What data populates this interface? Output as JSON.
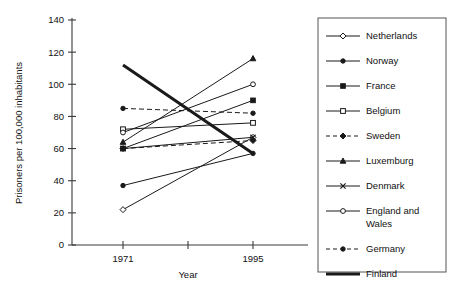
{
  "chart_data": {
    "type": "line",
    "title": "",
    "xlabel": "Year",
    "ylabel": "Prisoners per 100,000 inhabitants",
    "categories": [
      "1971",
      "1995"
    ],
    "x": [
      1971,
      1995
    ],
    "xlim": [
      1971,
      1995
    ],
    "ylim": [
      0,
      140
    ],
    "ytick_labels": [
      "0",
      "20",
      "40",
      "60",
      "80",
      "100",
      "120",
      "140"
    ],
    "ytick_values": [
      0,
      20,
      40,
      60,
      80,
      100,
      120,
      140
    ],
    "xtick_labels": [
      "1971",
      "1995"
    ],
    "grid": false,
    "legend_position": "right",
    "series": [
      {
        "name": "Netherlands",
        "values": [
          22,
          67
        ],
        "marker": "open-diamond",
        "dash": "solid",
        "width": 1.0
      },
      {
        "name": "Norway",
        "values": [
          37,
          57
        ],
        "marker": "filled-circle",
        "dash": "solid",
        "width": 1.0
      },
      {
        "name": "France",
        "values": [
          60,
          90
        ],
        "marker": "filled-square",
        "dash": "solid",
        "width": 1.0
      },
      {
        "name": "Belgium",
        "values": [
          72,
          76
        ],
        "marker": "open-square",
        "dash": "solid",
        "width": 1.0
      },
      {
        "name": "Sweden",
        "values": [
          60,
          65
        ],
        "marker": "filled-diamond",
        "dash": "dashed",
        "width": 1.0
      },
      {
        "name": "Luxemburg",
        "values": [
          64,
          116
        ],
        "marker": "filled-triangle",
        "dash": "solid",
        "width": 1.0
      },
      {
        "name": "Denmark",
        "values": [
          60,
          67
        ],
        "marker": "cross",
        "dash": "solid",
        "width": 1.0
      },
      {
        "name": "England and Wales",
        "values": [
          70,
          100
        ],
        "marker": "open-circle",
        "dash": "solid",
        "width": 1.0
      },
      {
        "name": "Germany",
        "values": [
          85,
          82
        ],
        "marker": "filled-circle",
        "dash": "dashed",
        "width": 1.0
      },
      {
        "name": "Finland",
        "values": [
          112,
          57
        ],
        "marker": "none",
        "dash": "solid",
        "width": 3.0
      }
    ]
  },
  "legend": {
    "entries": [
      {
        "label": "Netherlands"
      },
      {
        "label": "Norway"
      },
      {
        "label": "France"
      },
      {
        "label": "Belgium"
      },
      {
        "label": "Sweden"
      },
      {
        "label": "Luxemburg"
      },
      {
        "label": "Denmark"
      },
      {
        "label": "England and"
      },
      {
        "label": "Wales"
      },
      {
        "label": "Germany"
      },
      {
        "label": "Finland"
      }
    ]
  },
  "colors": {
    "ink": "#1a1a1a",
    "axis": "#3a3a3a",
    "background": "#ffffff"
  }
}
